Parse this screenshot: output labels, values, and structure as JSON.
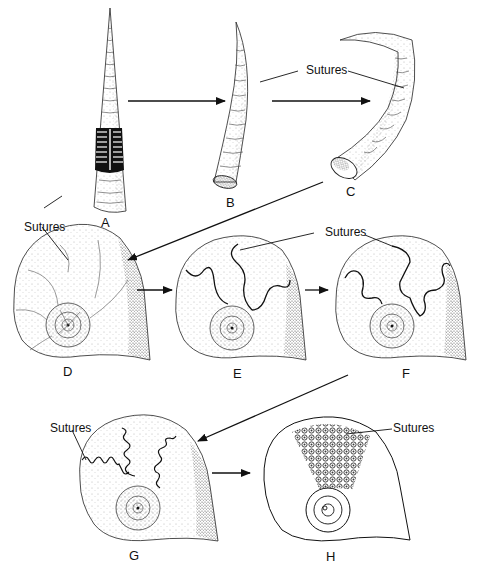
{
  "diagram": {
    "colors": {
      "ink": "#111111",
      "background": "#ffffff",
      "stipple": "#333333"
    },
    "stages": [
      {
        "id": "A",
        "label": "A",
        "form": "straight orthocone with cutaway septa"
      },
      {
        "id": "B",
        "label": "B",
        "form": "curved cyrtocone"
      },
      {
        "id": "C",
        "label": "C",
        "form": "more strongly curved cyrtocone"
      },
      {
        "id": "D",
        "label": "D",
        "form": "coiled shell, simple straight sutures"
      },
      {
        "id": "E",
        "label": "E",
        "form": "coiled shell, gently wavy sutures"
      },
      {
        "id": "F",
        "label": "F",
        "form": "coiled shell, lobed sutures"
      },
      {
        "id": "G",
        "label": "G",
        "form": "coiled shell, finely crenulated sutures"
      },
      {
        "id": "H",
        "label": "H",
        "form": "coiled shell, highly complex frilled sutures"
      }
    ],
    "callouts": {
      "sutures_bc": "Sutures",
      "sutures_ad": "Sutures",
      "sutures_ef": "Sutures",
      "sutures_g": "Sutures",
      "sutures_h": "Sutures"
    },
    "arrows": [
      {
        "from": "A",
        "to": "B"
      },
      {
        "from": "B",
        "to": "C"
      },
      {
        "from": "C",
        "to": "D"
      },
      {
        "from": "D",
        "to": "E"
      },
      {
        "from": "E",
        "to": "F"
      },
      {
        "from": "F",
        "to": "G"
      },
      {
        "from": "G",
        "to": "H"
      }
    ]
  }
}
